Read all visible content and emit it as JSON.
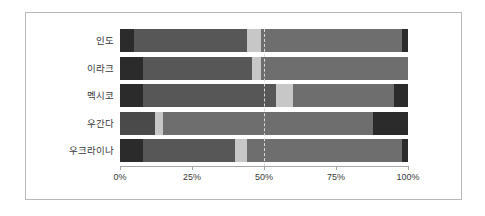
{
  "chart_data": {
    "type": "bar",
    "subtype": "stacked-horizontal-100-percent",
    "title": "",
    "xlabel": "",
    "ylabel": "",
    "orientation": "horizontal",
    "stacked": true,
    "normalized": true,
    "xlim": [
      0,
      100
    ],
    "xticks": [
      0,
      25,
      50,
      75,
      100
    ],
    "xtick_labels": [
      "0%",
      "25%",
      "50%",
      "75%",
      "100%"
    ],
    "grid": false,
    "reference_line": {
      "value": 50,
      "label": "50%",
      "style": "dashed",
      "color": "#d8d8d8"
    },
    "legend": null,
    "categories": [
      "인도",
      "이라크",
      "멕시코",
      "우간다",
      "우크라이나"
    ],
    "series": [
      {
        "name": "segment-1",
        "color": "#2b2b2b",
        "values": [
          5,
          8,
          8,
          12,
          8
        ]
      },
      {
        "name": "segment-2",
        "color": "#575757",
        "values": [
          39,
          38,
          46,
          3,
          32
        ]
      },
      {
        "name": "segment-3",
        "color": "#c7c7c7",
        "values": [
          5,
          3,
          6,
          73,
          4
        ]
      },
      {
        "name": "segment-4",
        "color": "#6e6e6e",
        "values": [
          49,
          51,
          35,
          0,
          54
        ]
      },
      {
        "name": "segment-5",
        "color": "#2b2b2b",
        "values": [
          2,
          0,
          5,
          12,
          2
        ]
      }
    ],
    "rows": [
      {
        "category": "인도",
        "segments": [
          {
            "start": 0,
            "end": 5,
            "color": "#2b2b2b"
          },
          {
            "start": 5,
            "end": 44,
            "color": "#575757"
          },
          {
            "start": 44,
            "end": 49,
            "color": "#c7c7c7"
          },
          {
            "start": 49,
            "end": 98,
            "color": "#6e6e6e"
          },
          {
            "start": 98,
            "end": 100,
            "color": "#2b2b2b"
          }
        ]
      },
      {
        "category": "이라크",
        "segments": [
          {
            "start": 0,
            "end": 8,
            "color": "#2b2b2b"
          },
          {
            "start": 8,
            "end": 46,
            "color": "#575757"
          },
          {
            "start": 46,
            "end": 49,
            "color": "#c7c7c7"
          },
          {
            "start": 49,
            "end": 100,
            "color": "#6e6e6e"
          }
        ]
      },
      {
        "category": "멕시코",
        "segments": [
          {
            "start": 0,
            "end": 8,
            "color": "#2b2b2b"
          },
          {
            "start": 8,
            "end": 54,
            "color": "#575757"
          },
          {
            "start": 54,
            "end": 60,
            "color": "#c7c7c7"
          },
          {
            "start": 60,
            "end": 95,
            "color": "#6e6e6e"
          },
          {
            "start": 95,
            "end": 100,
            "color": "#2b2b2b"
          }
        ]
      },
      {
        "category": "우간다",
        "segments": [
          {
            "start": 0,
            "end": 12,
            "color": "#4a4a4a"
          },
          {
            "start": 12,
            "end": 15,
            "color": "#c7c7c7"
          },
          {
            "start": 15,
            "end": 88,
            "color": "#6e6e6e"
          },
          {
            "start": 88,
            "end": 100,
            "color": "#2b2b2b"
          }
        ]
      },
      {
        "category": "우크라이나",
        "segments": [
          {
            "start": 0,
            "end": 8,
            "color": "#2b2b2b"
          },
          {
            "start": 8,
            "end": 40,
            "color": "#575757"
          },
          {
            "start": 40,
            "end": 44,
            "color": "#c7c7c7"
          },
          {
            "start": 44,
            "end": 98,
            "color": "#6e6e6e"
          },
          {
            "start": 98,
            "end": 100,
            "color": "#2b2b2b"
          }
        ]
      }
    ]
  },
  "axis": {
    "ticks": [
      {
        "value": 0,
        "label": "0%"
      },
      {
        "value": 25,
        "label": "25%"
      },
      {
        "value": 50,
        "label": "50%"
      },
      {
        "value": 75,
        "label": "75%"
      },
      {
        "value": 100,
        "label": "100%"
      }
    ]
  },
  "colors": {
    "background": "#ffffff",
    "frame": "#b9b9b9",
    "axis": "#a6a6a6",
    "text": "#3a3a3a",
    "gridline": "#d8d8d8"
  }
}
